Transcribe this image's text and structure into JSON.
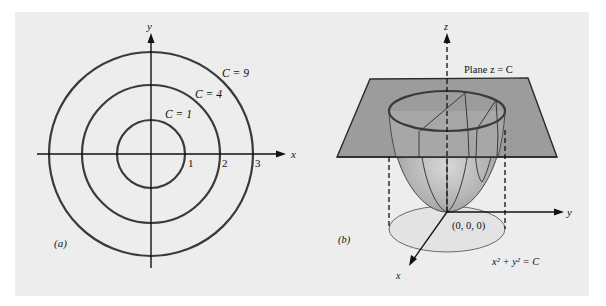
{
  "figure": {
    "background_color": "#ededed",
    "line_color": "#3a3a3a",
    "plane_color": "#9c9c9c",
    "base_fill_color": "#e3e3e3"
  },
  "panel_a": {
    "caption": "(a)",
    "x_axis_label": "x",
    "y_axis_label": "y",
    "tick_labels": [
      "1",
      "2",
      "3"
    ],
    "level_curves": [
      {
        "label": "C = 1",
        "radius": 1
      },
      {
        "label": "C = 4",
        "radius": 2
      },
      {
        "label": "C = 9",
        "radius": 3
      }
    ]
  },
  "panel_b": {
    "caption": "(b)",
    "z_axis_label": "z",
    "y_axis_label": "y",
    "x_axis_label": "x",
    "plane_label": "Plane z = C",
    "origin_label": "(0, 0, 0)",
    "equation_label": "x² + y² = C"
  }
}
